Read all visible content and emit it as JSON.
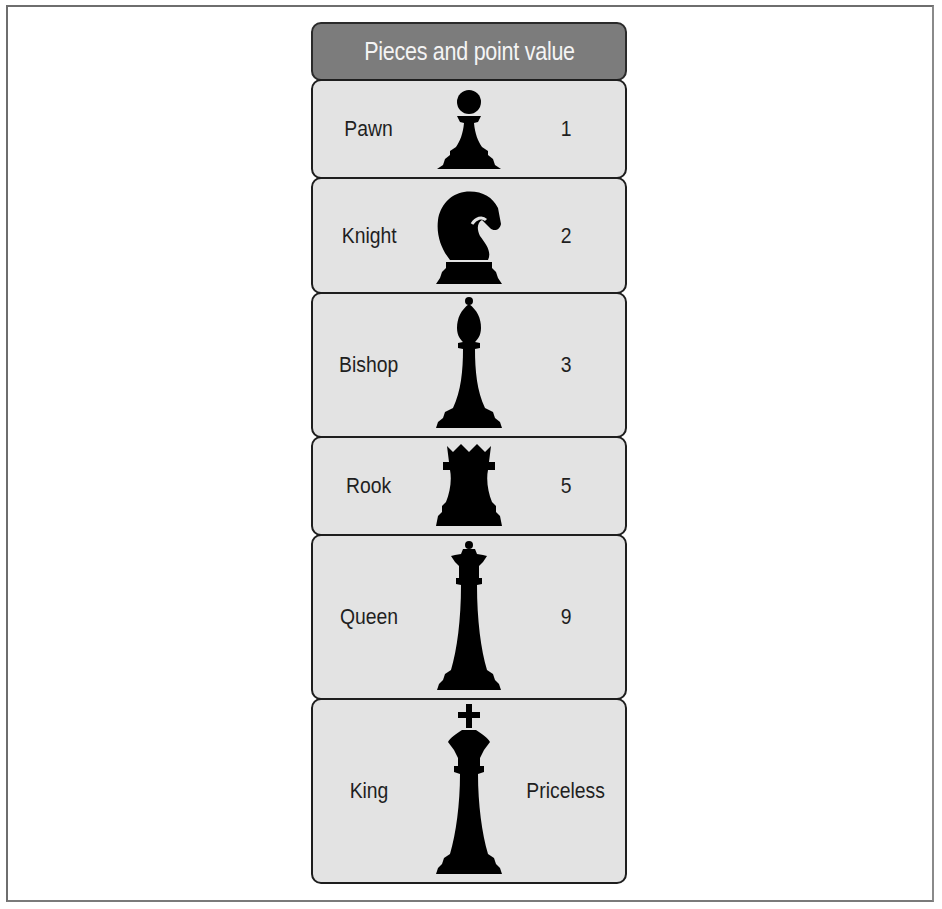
{
  "title": "Pieces and point value",
  "colors": {
    "header_bg": "#7c7c7c",
    "header_text": "#f4f4f4",
    "row_bg": "#e3e3e3",
    "border": "#1e1e1e",
    "piece": "#000000"
  },
  "rows": [
    {
      "name": "Pawn",
      "icon": "pawn-icon",
      "value": "1"
    },
    {
      "name": "Knight",
      "icon": "knight-icon",
      "value": "2"
    },
    {
      "name": "Bishop",
      "icon": "bishop-icon",
      "value": "3"
    },
    {
      "name": "Rook",
      "icon": "rook-icon",
      "value": "5"
    },
    {
      "name": "Queen",
      "icon": "queen-icon",
      "value": "9"
    },
    {
      "name": "King",
      "icon": "king-icon",
      "value": "Priceless"
    }
  ]
}
